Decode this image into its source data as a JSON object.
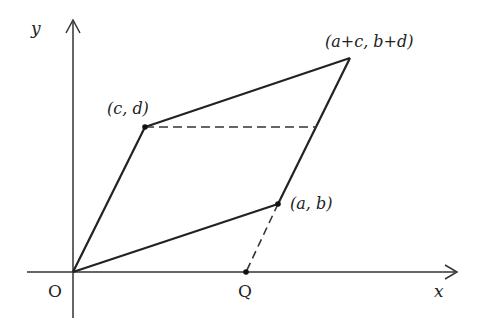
{
  "diagram": {
    "type": "parallelogram-vector-diagram",
    "axes": {
      "x_label": "x",
      "y_label": "y",
      "origin_label": "O"
    },
    "points": {
      "origin": {
        "label": "O"
      },
      "cd": {
        "label": "(c, d)"
      },
      "ab": {
        "label": "(a, b)"
      },
      "sum": {
        "label": "(a+c, b+d)"
      },
      "q": {
        "label": "Q"
      }
    },
    "colors": {
      "line": "#222222",
      "axis": "#333333",
      "background": "#ffffff"
    }
  }
}
